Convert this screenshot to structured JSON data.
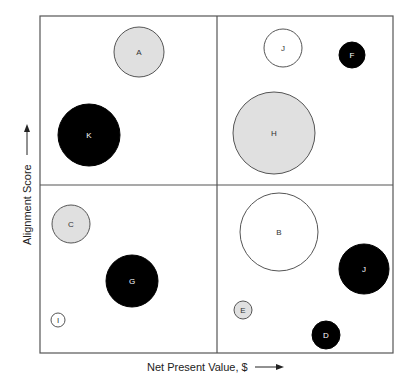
{
  "chart_data": {
    "type": "scatter",
    "subtype": "bubble-quadrant",
    "title": "",
    "xlabel": "Net Present Value, $",
    "ylabel": "Alignment Score",
    "grid": false,
    "legend": null,
    "axis_ticks": false,
    "plot_box": {
      "left": 40,
      "top": 16,
      "right": 393,
      "bottom": 353
    },
    "quadrant_dividers": {
      "x": 217,
      "y": 185
    },
    "fill_colors": {
      "black": "#000000",
      "gray": "#e0e0e0",
      "white": "#ffffff"
    },
    "bubbles": [
      {
        "label": "A",
        "cx": 139,
        "cy": 52,
        "r": 25,
        "fill": "gray"
      },
      {
        "label": "K",
        "cx": 89,
        "cy": 135,
        "r": 31,
        "fill": "black"
      },
      {
        "label": "J",
        "cx": 283,
        "cy": 48,
        "r": 19,
        "fill": "white"
      },
      {
        "label": "F",
        "cx": 352,
        "cy": 55,
        "r": 13,
        "fill": "black"
      },
      {
        "label": "H",
        "cx": 274,
        "cy": 133,
        "r": 41,
        "fill": "gray"
      },
      {
        "label": "C",
        "cx": 71,
        "cy": 224,
        "r": 19,
        "fill": "gray"
      },
      {
        "label": "G",
        "cx": 132,
        "cy": 281,
        "r": 26,
        "fill": "black"
      },
      {
        "label": "I",
        "cx": 58,
        "cy": 320,
        "r": 7,
        "fill": "white"
      },
      {
        "label": "B",
        "cx": 279,
        "cy": 232,
        "r": 39,
        "fill": "white"
      },
      {
        "label": "J",
        "cx": 364,
        "cy": 269,
        "r": 25,
        "fill": "black"
      },
      {
        "label": "E",
        "cx": 243,
        "cy": 310,
        "r": 9,
        "fill": "gray"
      },
      {
        "label": "D",
        "cx": 326,
        "cy": 335,
        "r": 14,
        "fill": "black"
      }
    ]
  },
  "axes": {
    "x_label": "Net Present Value, $",
    "y_label": "Alignment Score"
  }
}
